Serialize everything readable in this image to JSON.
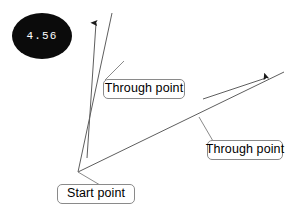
{
  "diagram": {
    "background_color": "#ffffff",
    "stroke_color": "#595959",
    "callout_border_color": "#8a8a8a",
    "bubble": {
      "value": "4.56",
      "fill_color": "#0b0b0b",
      "text_color": "#ffffff",
      "shape": "ellipse"
    },
    "labels": {
      "through_point_1": "Through point",
      "through_point_2": "Through point",
      "start_point": "Start point"
    },
    "geometry": {
      "start_vertex": {
        "x": 78,
        "y": 172
      },
      "rays": [
        {
          "name": "steep-ray",
          "from": {
            "x": 78,
            "y": 172
          },
          "to": {
            "x": 112,
            "y": 13
          }
        },
        {
          "name": "shallow-ray",
          "from": {
            "x": 78,
            "y": 172
          },
          "to": {
            "x": 284,
            "y": 72
          }
        }
      ],
      "direction_arrows": [
        {
          "name": "steep-direction-arrow",
          "from": {
            "x": 87,
            "y": 158
          },
          "to": {
            "x": 96,
            "y": 21
          }
        },
        {
          "name": "shallow-direction-arrow",
          "from": {
            "x": 203,
            "y": 99
          },
          "to": {
            "x": 268,
            "y": 77
          }
        }
      ],
      "leaders": [
        {
          "name": "leader-through-1",
          "from": {
            "x": 124,
            "y": 61
          },
          "to": {
            "x": 105,
            "y": 80
          }
        },
        {
          "name": "leader-through-2",
          "from": {
            "x": 199,
            "y": 117
          },
          "to": {
            "x": 213,
            "y": 141
          }
        },
        {
          "name": "leader-start",
          "from": {
            "x": 78,
            "y": 172
          },
          "to": {
            "x": 100,
            "y": 185
          }
        }
      ]
    }
  }
}
